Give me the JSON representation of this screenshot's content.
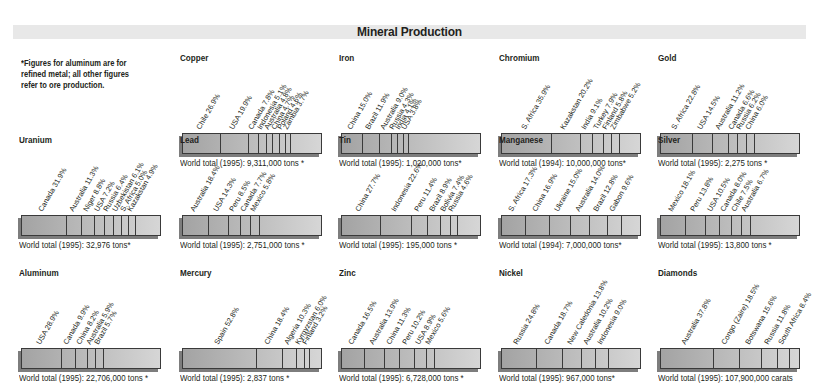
{
  "title": "Mineral Production",
  "note": "*Figures for aluminum are for refined metal; all other figures refer to ore production.",
  "chart_data": [
    {
      "type": "bar",
      "title": "Copper",
      "stacked": true,
      "categories": [
        "Chile",
        "USA",
        "Canada",
        "Indonesia",
        "Australia",
        "China",
        "Poland",
        "Zambia"
      ],
      "values": [
        26.9,
        19.9,
        7.8,
        5.1,
        4.8,
        4.7,
        4.6,
        3.7
      ],
      "unit": "%",
      "total": "World total (1995): 9,311,000 tons *"
    },
    {
      "type": "bar",
      "title": "Iron",
      "stacked": true,
      "categories": [
        "China",
        "Brazil",
        "Australia",
        "Russia",
        "India",
        "USA"
      ],
      "values": [
        15.0,
        11.9,
        9.0,
        4.3,
        4.1,
        3.8
      ],
      "unit": "%",
      "total": "World total (1995): 1,020,000 tons*"
    },
    {
      "type": "bar",
      "title": "Chromium",
      "stacked": true,
      "categories": [
        "S. Africa",
        "Kazakstan",
        "India",
        "Turkey",
        "Finland",
        "Zimbabwe"
      ],
      "values": [
        35.9,
        20.2,
        9.1,
        7.9,
        5.8,
        5.2
      ],
      "unit": "%",
      "total": "World total (1994): 10,000,000 tons*"
    },
    {
      "type": "bar",
      "title": "Gold",
      "stacked": true,
      "categories": [
        "S. Africa",
        "USA",
        "Australia",
        "Canada",
        "Russia",
        "China"
      ],
      "values": [
        22.8,
        14.5,
        11.2,
        6.6,
        6.2,
        6.0
      ],
      "unit": "%",
      "total": "World total (1995): 2,275 tons *"
    },
    {
      "type": "bar",
      "title": "Uranium",
      "stacked": true,
      "categories": [
        "Canada",
        "Australia",
        "Niger",
        "USA",
        "Russia",
        "Uzbekistan",
        "S. Africa",
        "Kazakstan"
      ],
      "values": [
        31.9,
        11.3,
        8.8,
        7.2,
        6.4,
        6.1,
        5.0,
        4.9
      ],
      "unit": "%",
      "total": "World total (1995): 32,976 tons*"
    },
    {
      "type": "bar",
      "title": "Lead",
      "stacked": true,
      "categories": [
        "Australia",
        "USA",
        "Peru",
        "Canada",
        "Mexico"
      ],
      "values": [
        18.4,
        14.3,
        8.5,
        7.7,
        5.8
      ],
      "unit": "%",
      "total": "World total (1995): 2,751,000 tons *"
    },
    {
      "type": "bar",
      "title": "Tin",
      "stacked": true,
      "categories": [
        "China",
        "Indonesia",
        "Peru",
        "Brazil",
        "Bolivia",
        "Russia"
      ],
      "values": [
        27.7,
        22.6,
        11.4,
        8.9,
        7.4,
        4.6
      ],
      "unit": "%",
      "total": "World total (1995): 195,000 tons *"
    },
    {
      "type": "bar",
      "title": "Manganese",
      "stacked": true,
      "categories": [
        "S. Africa",
        "China",
        "Ukraine",
        "Australia",
        "Brazil",
        "Gabon"
      ],
      "values": [
        17.3,
        16.9,
        15.0,
        14.0,
        12.8,
        9.6
      ],
      "unit": "%",
      "total": "World total (1994): 7,000,000 tons*"
    },
    {
      "type": "bar",
      "title": "Silver",
      "stacked": true,
      "categories": [
        "Mexico",
        "Peru",
        "USA",
        "Canada",
        "Chile",
        "Australia"
      ],
      "values": [
        18.1,
        13.8,
        10.5,
        8.0,
        7.5,
        6.7
      ],
      "unit": "%",
      "total": "World total (1995): 13,800 tons *"
    },
    {
      "type": "bar",
      "title": "Aluminum",
      "stacked": true,
      "categories": [
        "USA",
        "Canada",
        "China",
        "Australia",
        "Brazil"
      ],
      "values": [
        28.9,
        9.9,
        8.2,
        5.9,
        5.7
      ],
      "unit": "%",
      "total": "World total (1995): 22,706,000 tons *"
    },
    {
      "type": "bar",
      "title": "Mercury",
      "stacked": true,
      "categories": [
        "Spain",
        "China",
        "Algeria",
        "Kyrgyzstan",
        "Finland"
      ],
      "values": [
        52.8,
        18.4,
        10.3,
        6.0,
        3.2
      ],
      "unit": "%",
      "total": "World total (1995): 2,837 tons *"
    },
    {
      "type": "bar",
      "title": "Zinc",
      "stacked": true,
      "categories": [
        "Canada",
        "Australia",
        "China",
        "Peru",
        "USA",
        "Mexico"
      ],
      "values": [
        16.5,
        13.9,
        11.3,
        10.2,
        8.9,
        5.6
      ],
      "unit": "%",
      "total": "World total (1995): 6,728,000 tons *"
    },
    {
      "type": "bar",
      "title": "Nickel",
      "stacked": true,
      "categories": [
        "Russia",
        "Canada",
        "New Caledonia",
        "Australia",
        "Indonesia"
      ],
      "values": [
        24.8,
        18.7,
        13.8,
        10.2,
        9.0
      ],
      "unit": "%",
      "total": "World total (1995): 967,000 tons*"
    },
    {
      "type": "bar",
      "title": "Diamonds",
      "stacked": true,
      "categories": [
        "Australia",
        "Congo (Zaire)",
        "Botswana",
        "Russia",
        "South Africa"
      ],
      "values": [
        37.8,
        18.5,
        15.6,
        11.8,
        8.4
      ],
      "unit": "%",
      "total": "World total (1995): 107,900,000 carats"
    }
  ],
  "layout": {
    "positions": [
      [
        180,
        53
      ],
      [
        339,
        53
      ],
      [
        499,
        53
      ],
      [
        658,
        53
      ],
      [
        19,
        135
      ],
      [
        180,
        135
      ],
      [
        339,
        135
      ],
      [
        499,
        135
      ],
      [
        658,
        135
      ],
      [
        19,
        268
      ],
      [
        180,
        268
      ],
      [
        339,
        268
      ],
      [
        499,
        268
      ],
      [
        658,
        268
      ]
    ]
  }
}
